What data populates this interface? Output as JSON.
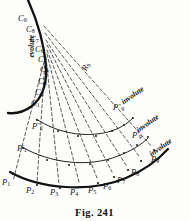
{
  "figure": {
    "caption": "Fig. 241",
    "background_color": "#fdfdfc",
    "ink_color": "#141414"
  },
  "curves": {
    "evolute": {
      "name": "evolute",
      "label": "evolute",
      "style": "solid-thick",
      "stroke": "#111111",
      "width": 2.3
    },
    "involute_outer": {
      "label": "involute",
      "style": "solid-thick",
      "stroke": "#111111",
      "width": 2.2
    },
    "involute_middle": {
      "label": "involute",
      "style": "solid-thin",
      "stroke": "#222222",
      "width": 1.0
    },
    "involute_inner": {
      "label": "involute",
      "style": "solid-thin",
      "stroke": "#222222",
      "width": 1.0
    },
    "radii": {
      "label": "R",
      "style": "dashed",
      "stroke": "#333333",
      "width": 0.8,
      "count": 9
    }
  },
  "labels": {
    "evolute_points": [
      {
        "base": "C",
        "sub": "9",
        "sup": "",
        "x": 18,
        "y": 14
      },
      {
        "base": "C",
        "sub": "8",
        "sup": "",
        "x": 26,
        "y": 25
      },
      {
        "base": "C",
        "sub": "7",
        "sup": "",
        "x": 30,
        "y": 35
      },
      {
        "base": "C",
        "sub": "6",
        "sup": "",
        "x": 35,
        "y": 45
      },
      {
        "base": "C",
        "sub": "5",
        "sup": "",
        "x": 38,
        "y": 55
      },
      {
        "base": "C",
        "sub": "4",
        "sup": "",
        "x": 40,
        "y": 65
      },
      {
        "base": "C",
        "sub": "3",
        "sup": "",
        "x": 38,
        "y": 77
      },
      {
        "base": "C",
        "sub": "2",
        "sup": "",
        "x": 35,
        "y": 88
      },
      {
        "base": "C",
        "sub": "1",
        "sup": "",
        "x": 31,
        "y": 99
      }
    ],
    "involute_points": [
      {
        "base": "P",
        "sub": "1",
        "sup": "",
        "x": 2,
        "y": 178
      },
      {
        "base": "P",
        "sub": "2",
        "sup": "",
        "x": 26,
        "y": 186
      },
      {
        "base": "P",
        "sub": "3",
        "sup": "",
        "x": 50,
        "y": 188
      },
      {
        "base": "P",
        "sub": "4",
        "sup": "",
        "x": 70,
        "y": 188
      },
      {
        "base": "P",
        "sub": "5",
        "sup": "",
        "x": 88,
        "y": 186
      },
      {
        "base": "P",
        "sub": "6",
        "sup": "",
        "x": 103,
        "y": 182
      },
      {
        "base": "P",
        "sub": "7",
        "sup": "",
        "x": 117,
        "y": 176
      },
      {
        "base": "P",
        "sub": "8",
        "sup": "",
        "x": 131,
        "y": 168
      },
      {
        "base": "P",
        "sub": "9",
        "sup": "",
        "x": 151,
        "y": 155
      },
      {
        "base": "P",
        "sub": "1",
        "sup": "′",
        "x": 17,
        "y": 144
      },
      {
        "base": "P",
        "sub": "9",
        "sup": "′",
        "x": 132,
        "y": 131
      },
      {
        "base": "P",
        "sub": "1",
        "sup": "″",
        "x": 32,
        "y": 122
      },
      {
        "base": "P",
        "sub": "9",
        "sup": "″",
        "x": 113,
        "y": 103
      }
    ],
    "radius": {
      "base": "R",
      "sub": "9",
      "sup": "",
      "x": 82,
      "y": 62,
      "rotation": -62
    },
    "words": [
      {
        "text": "evolute",
        "x": 31,
        "y": 53,
        "rotation": -90
      },
      {
        "text": "involute",
        "x": 122,
        "y": 98,
        "rotation": -35
      },
      {
        "text": "involute",
        "x": 137,
        "y": 126,
        "rotation": -35
      },
      {
        "text": "involute",
        "x": 150,
        "y": 150,
        "rotation": -35
      }
    ]
  }
}
